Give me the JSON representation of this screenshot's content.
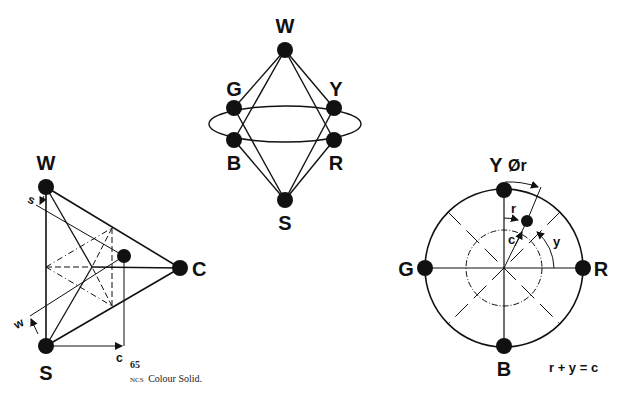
{
  "top_diagram": {
    "labels": {
      "W": "W",
      "G": "G",
      "Y": "Y",
      "B": "B",
      "R": "R",
      "S": "S"
    }
  },
  "triangle_diagram": {
    "labels": {
      "W": "W",
      "S": "S",
      "C": "C",
      "s": "s",
      "w": "w",
      "c": "c"
    }
  },
  "circle_diagram": {
    "labels": {
      "Y": "Y",
      "phi_r": "Ør",
      "G": "G",
      "R": "R",
      "B": "B",
      "r": "r",
      "c": "c",
      "y": "y"
    },
    "formula": "r + y = c"
  },
  "caption": {
    "number": "65",
    "prefix": "NCS",
    "text": "Colour Solid."
  },
  "colors": {
    "ink": "#111111",
    "background": "#ffffff"
  }
}
